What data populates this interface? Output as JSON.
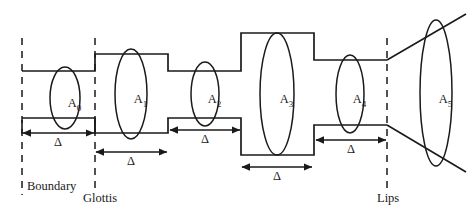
{
  "figure": {
    "type": "acoustic-tube-model-diagram",
    "stroke_color": "#1a1a1a",
    "background_color": "#ffffff"
  },
  "sections": [
    {
      "id": "A0",
      "label": "A",
      "subscript": "0"
    },
    {
      "id": "A1",
      "label": "A",
      "subscript": "1"
    },
    {
      "id": "A2",
      "label": "A",
      "subscript": "2"
    },
    {
      "id": "A3",
      "label": "A",
      "subscript": "3"
    },
    {
      "id": "A4",
      "label": "A",
      "subscript": "4"
    },
    {
      "id": "A5",
      "label": "A",
      "subscript": "5"
    }
  ],
  "length_arrows": [
    {
      "id": "delta-0",
      "label": "Δ"
    },
    {
      "id": "delta-1",
      "label": "Δ"
    },
    {
      "id": "delta-2",
      "label": "Δ"
    },
    {
      "id": "delta-3",
      "label": "Δ"
    },
    {
      "id": "delta-4",
      "label": "Δ"
    }
  ],
  "annotations": {
    "boundary": {
      "line1": "Boundary",
      "line2": "condition",
      "line3": "artificial",
      "line4": "section"
    },
    "glottis": "Glottis",
    "lips": "Lips"
  }
}
